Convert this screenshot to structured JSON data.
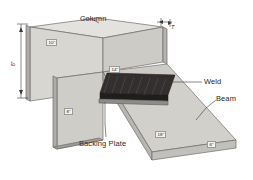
{
  "figure": {
    "background": "#ffffff",
    "colors": {
      "face_light": "#d8d6d1",
      "face_mid": "#c6c4bf",
      "face_dark": "#b0aeaa",
      "top_highlight": "#e4e2de",
      "weld_dark": "#2e2c2b",
      "weld_mid": "#4a4846",
      "outline": "#6e6c69",
      "label_text": "#2b2b2b",
      "dim_box_fill": "#f2f1ee",
      "dim_box_border": "#9a9a98"
    }
  },
  "callouts": [
    {
      "name": "column",
      "label": "Column"
    },
    {
      "name": "weld",
      "label": "Weld"
    },
    {
      "name": "beam",
      "label": "Beam"
    },
    {
      "name": "backing-plate",
      "label": "Backing Plate"
    }
  ],
  "dimensions": {
    "column_height": "8\"",
    "column_face_width": "10\"",
    "column_flange_thickness": "T",
    "beam_flange_width": "14\"",
    "column_lower_height": "8\"",
    "beam_length": "18\"",
    "beam_end_width": "6\""
  }
}
